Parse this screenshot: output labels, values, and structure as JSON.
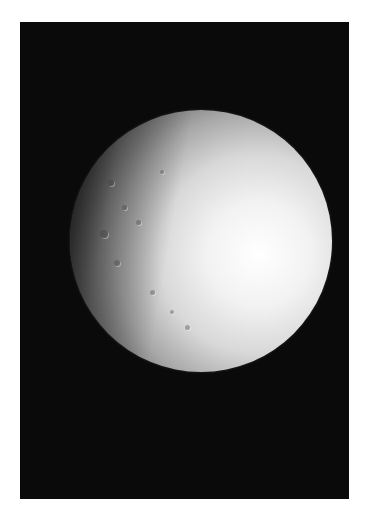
{
  "image": {
    "subject": "moon",
    "description": "Grayscale photograph of a cratered icy moon, illuminated from the right, against black space",
    "background_color": "#0a0a0a",
    "surface_color": "#f0f0f0",
    "frame_color": "#ffffff"
  }
}
